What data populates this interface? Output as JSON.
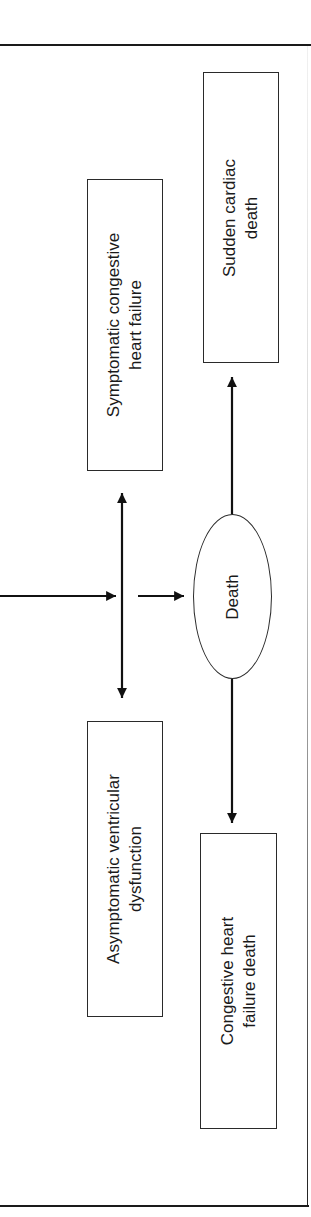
{
  "diagram": {
    "orientation": "rotated-90-ccw",
    "nodes": {
      "symptomatic_chf": {
        "label_line1": "Symptomatic congestive",
        "label_line2": "heart failure"
      },
      "asymptomatic_vd": {
        "label_line1": "Asymptomatic ventricular",
        "label_line2": "dysfunction"
      },
      "death": {
        "label": "Death"
      },
      "sudden_cardiac_death": {
        "label_line1": "Sudden cardiac",
        "label_line2": "death"
      },
      "chf_death": {
        "label_line1": "Congestive heart",
        "label_line2": "failure death"
      }
    },
    "edges": [
      {
        "from": "input",
        "to": "junction",
        "type": "arrow"
      },
      {
        "from": "junction",
        "to": "symptomatic_chf",
        "type": "double-arrow"
      },
      {
        "from": "junction",
        "to": "asymptomatic_vd",
        "type": "double-arrow"
      },
      {
        "from": "junction",
        "to": "death",
        "type": "arrow"
      },
      {
        "from": "death",
        "to": "sudden_cardiac_death",
        "type": "arrow"
      },
      {
        "from": "death",
        "to": "chf_death",
        "type": "arrow"
      }
    ],
    "colors": {
      "stroke": "#1a1a1a",
      "background": "#ffffff"
    }
  }
}
